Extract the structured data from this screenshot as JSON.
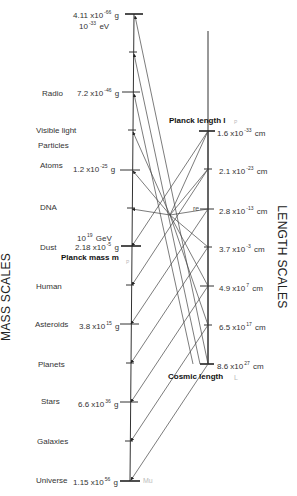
{
  "axes": {
    "mass_title": "MASS SCALES",
    "length_title": "LENGTH SCALES"
  },
  "mass_scale": [
    {
      "label": "",
      "mantissa": "4.11 x10",
      "exp": "-66",
      "unit": "g",
      "extra": "10",
      "extra_exp": "-33",
      "extra_unit": "eV"
    },
    {
      "label": "Radio",
      "mantissa": "7.2 x10",
      "exp": "-46",
      "unit": "g"
    },
    {
      "label": "Visible light"
    },
    {
      "label": "Particles"
    },
    {
      "label": "Atoms",
      "mantissa": "1.2 x10",
      "exp": "-25",
      "unit": "g"
    },
    {
      "label": "DNA"
    },
    {
      "label": "Dust",
      "mantissa": "2.18 x10",
      "exp": "-5",
      "unit": "g",
      "extra": "10",
      "extra_exp": "19",
      "extra_unit": "GeV"
    },
    {
      "label": "Human"
    },
    {
      "label": "Asteroids",
      "mantissa": "3.8 x10",
      "exp": "15",
      "unit": "g"
    },
    {
      "label": "Planets"
    },
    {
      "label": "Stars",
      "mantissa": "6.6 x10",
      "exp": "36",
      "unit": "g"
    },
    {
      "label": "Galaxies"
    },
    {
      "label": "Universe",
      "mantissa": "1.15 x10",
      "exp": "56",
      "unit": "g"
    }
  ],
  "length_scale": [
    {
      "mantissa": "1.6 x10",
      "exp": "-33",
      "unit": "cm"
    },
    {
      "mantissa": "2.1 x10",
      "exp": "-23",
      "unit": "cm"
    },
    {
      "mantissa": "2.8 x10",
      "exp": "-13",
      "unit": "cm",
      "tag": "re"
    },
    {
      "mantissa": "3.7 x10",
      "exp": "-3",
      "unit": "cm"
    },
    {
      "mantissa": "4.9 x10",
      "exp": "7",
      "unit": "cm"
    },
    {
      "mantissa": "6.5 x10",
      "exp": "17",
      "unit": "cm"
    },
    {
      "mantissa": "8.6 x10",
      "exp": "27",
      "unit": "cm"
    }
  ],
  "annotations": {
    "planck_mass": "Planck mass m",
    "planck_mass_sub": "P",
    "planck_length": "Planck length l",
    "planck_length_sub": "P",
    "cosmic_length": "Cosmic length",
    "cosmic_length_sub": "L",
    "universe_mass_sub": "Mu"
  },
  "colors": {
    "line": "#333333",
    "text": "#333333",
    "faint": "#bbbbbb"
  }
}
